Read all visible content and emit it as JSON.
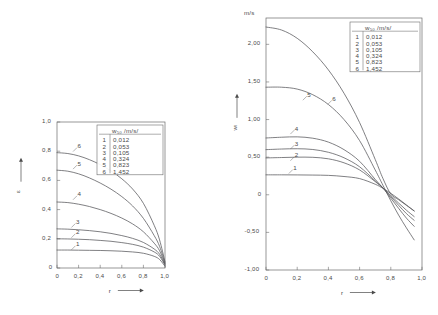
{
  "figure": {
    "title": "",
    "legend_header": "w₅₀ /m/s/",
    "legend_rows": [
      {
        "key": "1",
        "value": "0,012"
      },
      {
        "key": "2",
        "value": "0,053"
      },
      {
        "key": "3",
        "value": "0,105"
      },
      {
        "key": "4",
        "value": "0,324"
      },
      {
        "key": "5",
        "value": "0,823"
      },
      {
        "key": "6",
        "value": "1,452"
      }
    ]
  },
  "chart_data": [
    {
      "id": "left",
      "type": "line",
      "title": "",
      "xlabel": "r",
      "ylabel": "ε",
      "yunit": "",
      "xlim": [
        0,
        1.0
      ],
      "ylim": [
        0,
        1.0
      ],
      "grid": false,
      "legend_position": "top-right",
      "xticks": [
        0,
        0.2,
        0.4,
        0.6,
        0.8,
        1.0
      ],
      "xticklabels": [
        "0",
        "0,2",
        "0,4",
        "0,6",
        "0,8",
        "1,0"
      ],
      "yticks": [
        0,
        0.2,
        0.4,
        0.6,
        0.8,
        1.0
      ],
      "yticklabels": [
        "0",
        "0,2",
        "0,4",
        "0,6",
        "0,8",
        "1,0"
      ],
      "x": [
        0,
        0.1,
        0.2,
        0.3,
        0.4,
        0.5,
        0.6,
        0.7,
        0.8,
        0.9,
        0.95,
        1.0
      ],
      "series": [
        {
          "name": "1",
          "label": "1",
          "w50": "0,012",
          "values": [
            0.123,
            0.123,
            0.122,
            0.121,
            0.12,
            0.118,
            0.115,
            0.11,
            0.101,
            0.08,
            0.058,
            0.012
          ]
        },
        {
          "name": "2",
          "label": "2",
          "w50": "0,053",
          "values": [
            0.2,
            0.199,
            0.197,
            0.194,
            0.189,
            0.183,
            0.174,
            0.162,
            0.143,
            0.11,
            0.08,
            0.02
          ]
        },
        {
          "name": "3",
          "label": "3",
          "w50": "0,105",
          "values": [
            0.268,
            0.266,
            0.262,
            0.256,
            0.248,
            0.237,
            0.222,
            0.203,
            0.175,
            0.13,
            0.094,
            0.025
          ]
        },
        {
          "name": "4",
          "label": "4",
          "w50": "0,324",
          "values": [
            0.452,
            0.448,
            0.437,
            0.421,
            0.4,
            0.374,
            0.342,
            0.302,
            0.248,
            0.17,
            0.118,
            0.03
          ]
        },
        {
          "name": "5",
          "label": "5",
          "w50": "0,823",
          "values": [
            0.67,
            0.663,
            0.645,
            0.617,
            0.582,
            0.54,
            0.489,
            0.425,
            0.34,
            0.222,
            0.148,
            0.035
          ]
        },
        {
          "name": "6",
          "label": "6",
          "w50": "1,452",
          "values": [
            0.79,
            0.784,
            0.768,
            0.742,
            0.708,
            0.665,
            0.611,
            0.541,
            0.443,
            0.292,
            0.192,
            0.042
          ]
        }
      ],
      "curve_labels": [
        {
          "text": "6",
          "x": 0.19,
          "y": 0.835
        },
        {
          "text": "5",
          "x": 0.19,
          "y": 0.715
        },
        {
          "text": "4",
          "x": 0.19,
          "y": 0.505
        },
        {
          "text": "3",
          "x": 0.175,
          "y": 0.315
        },
        {
          "text": "2",
          "x": 0.175,
          "y": 0.245
        },
        {
          "text": "1",
          "x": 0.175,
          "y": 0.162
        }
      ]
    },
    {
      "id": "right",
      "type": "line",
      "title": "",
      "xlabel": "r",
      "ylabel": "wₗ",
      "yunit": "m/s",
      "xlim": [
        0,
        1.0
      ],
      "ylim": [
        -1.0,
        2.35
      ],
      "grid": false,
      "legend_position": "top-right",
      "xticks": [
        0,
        0.2,
        0.4,
        0.6,
        0.8,
        1.0
      ],
      "xticklabels": [
        "0",
        "0,2",
        "0,4",
        "0,6",
        "0,8",
        "1,0"
      ],
      "yticks": [
        -1.0,
        -0.5,
        0,
        0.5,
        1.0,
        1.5,
        2.0
      ],
      "yticklabels": [
        "-1,00",
        "-0,50",
        "0",
        "0,50",
        "1,00",
        "1,50",
        "2,00"
      ],
      "x": [
        0,
        0.1,
        0.2,
        0.3,
        0.4,
        0.5,
        0.6,
        0.7,
        0.75,
        0.8,
        0.85,
        0.9,
        0.95
      ],
      "crossing_point": {
        "x": 0.72,
        "y": 0.1
      },
      "series": [
        {
          "name": "1",
          "label": "1",
          "w50": "0,012",
          "values": [
            0.265,
            0.265,
            0.264,
            0.262,
            0.258,
            0.243,
            0.215,
            0.14,
            0.085,
            0.02,
            -0.055,
            -0.135,
            -0.215
          ]
        },
        {
          "name": "2",
          "label": "2",
          "w50": "0,053",
          "values": [
            0.49,
            0.495,
            0.5,
            0.498,
            0.478,
            0.425,
            0.33,
            0.175,
            0.09,
            -0.01,
            -0.11,
            -0.205,
            -0.29
          ]
        },
        {
          "name": "3",
          "label": "3",
          "w50": "0,105",
          "values": [
            0.6,
            0.608,
            0.612,
            0.602,
            0.565,
            0.492,
            0.372,
            0.185,
            0.09,
            -0.025,
            -0.14,
            -0.25,
            -0.34
          ]
        },
        {
          "name": "4",
          "label": "4",
          "w50": "0,324",
          "values": [
            0.755,
            0.765,
            0.77,
            0.752,
            0.7,
            0.6,
            0.445,
            0.205,
            0.09,
            -0.045,
            -0.18,
            -0.31,
            -0.42
          ]
        },
        {
          "name": "5",
          "label": "5",
          "w50": "0,823",
          "values": [
            1.43,
            1.43,
            1.405,
            1.33,
            1.2,
            1.0,
            0.72,
            0.33,
            0.125,
            -0.08,
            -0.27,
            -0.44,
            -0.6
          ]
        },
        {
          "name": "6",
          "label": "6",
          "w50": "1,452",
          "values": [
            2.23,
            2.19,
            2.08,
            1.9,
            1.66,
            1.35,
            0.96,
            0.47,
            0.215,
            0.01,
            -0.065,
            -0.14,
            -0.215
          ]
        }
      ],
      "curve_labels": [
        {
          "text": "6",
          "x": 0.425,
          "y": 1.275
        },
        {
          "text": "5",
          "x": 0.265,
          "y": 1.33
        },
        {
          "text": "4",
          "x": 0.185,
          "y": 0.88
        },
        {
          "text": "3",
          "x": 0.185,
          "y": 0.68
        },
        {
          "text": "2",
          "x": 0.185,
          "y": 0.525
        },
        {
          "text": "1",
          "x": 0.175,
          "y": 0.355
        }
      ]
    }
  ]
}
